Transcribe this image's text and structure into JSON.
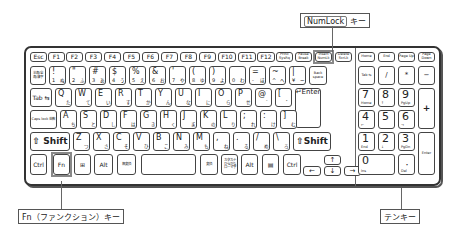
{
  "callouts": {
    "numlock": {
      "key_label": "NumLock",
      "suffix": "キー"
    },
    "fn": "Fn（ファンクション）キー",
    "tenkey": "テンキー"
  },
  "rows": {
    "function_row": [
      "Esc",
      "F1",
      "F2",
      "F3",
      "F4",
      "F5",
      "F6",
      "F7",
      "F8",
      "F9",
      "F10",
      "F11",
      "F12",
      "PrtSc SysRq",
      "Pause Break",
      "Insert NumLk",
      "Delete ScrLk"
    ],
    "nav_top": [
      "Home",
      "End",
      "Page Up",
      "Page Down"
    ],
    "number_row": [
      {
        "main": "半角/全角/漢字",
        "shift": "",
        "kana": ""
      },
      {
        "main": "1",
        "shift": "!",
        "kana": "ぬ"
      },
      {
        "main": "2",
        "shift": "\"",
        "kana": "ふ"
      },
      {
        "main": "3",
        "shift": "#",
        "kana": "あ"
      },
      {
        "main": "4",
        "shift": "$",
        "kana": "う"
      },
      {
        "main": "5",
        "shift": "%",
        "kana": "え"
      },
      {
        "main": "6",
        "shift": "&",
        "kana": "お"
      },
      {
        "main": "7",
        "shift": "'",
        "kana": "や"
      },
      {
        "main": "8",
        "shift": "(",
        "kana": "ゆ"
      },
      {
        "main": "9",
        "shift": ")",
        "kana": "よ"
      },
      {
        "main": "0",
        "shift": "",
        "kana": "わ"
      },
      {
        "main": "-",
        "shift": "=",
        "kana": "ほ"
      },
      {
        "main": "^",
        "shift": "~",
        "kana": "へ"
      },
      {
        "main": "¥",
        "shift": "|",
        "kana": "ー"
      },
      {
        "main": "Back space",
        "shift": "",
        "kana": ""
      }
    ],
    "qwerty_row": [
      {
        "main": "Tab ⇆",
        "kana": ""
      },
      {
        "main": "Q",
        "kana": "た"
      },
      {
        "main": "W",
        "kana": "て"
      },
      {
        "main": "E",
        "kana": "い"
      },
      {
        "main": "R",
        "kana": "す"
      },
      {
        "main": "T",
        "kana": "か"
      },
      {
        "main": "Y",
        "kana": "ん"
      },
      {
        "main": "U",
        "kana": "な"
      },
      {
        "main": "I",
        "kana": "に"
      },
      {
        "main": "O",
        "kana": "ら"
      },
      {
        "main": "P",
        "kana": "せ"
      },
      {
        "main": "@",
        "kana": "゛"
      },
      {
        "main": "[",
        "kana": "゜"
      },
      {
        "main": "↵Enter",
        "kana": ""
      }
    ],
    "home_row": [
      {
        "main": "Caps lock 英数",
        "kana": ""
      },
      {
        "main": "A",
        "kana": "ち"
      },
      {
        "main": "S",
        "kana": "と"
      },
      {
        "main": "D",
        "kana": "し"
      },
      {
        "main": "F",
        "kana": "は"
      },
      {
        "main": "G",
        "kana": "き"
      },
      {
        "main": "H",
        "kana": "く"
      },
      {
        "main": "J",
        "kana": "ま"
      },
      {
        "main": "K",
        "kana": "の"
      },
      {
        "main": "L",
        "kana": "り"
      },
      {
        "main": ";",
        "kana": "れ"
      },
      {
        "main": ":",
        "kana": "け"
      },
      {
        "main": "]",
        "kana": "む"
      }
    ],
    "shift_row": [
      {
        "main": "⇧ Shift",
        "kana": ""
      },
      {
        "main": "Z",
        "kana": "つ"
      },
      {
        "main": "X",
        "kana": "さ"
      },
      {
        "main": "C",
        "kana": "そ"
      },
      {
        "main": "V",
        "kana": "ひ"
      },
      {
        "main": "B",
        "kana": "こ"
      },
      {
        "main": "N",
        "kana": "み"
      },
      {
        "main": "M",
        "kana": "も"
      },
      {
        "main": ",",
        "kana": "ね"
      },
      {
        "main": ".",
        "kana": "る"
      },
      {
        "main": "/",
        "kana": "め"
      },
      {
        "main": "\\",
        "kana": "ろ"
      },
      {
        "main": "⇧Shift",
        "kana": ""
      }
    ],
    "bottom_row": [
      "Ctrl",
      "Fn",
      "⊞",
      "Alt",
      "無変換",
      "",
      "変換",
      "カタカナ ひらがな ローマ字",
      "Alt",
      "▤",
      "Ctrl"
    ],
    "arrows": [
      "↑",
      "←",
      "↓",
      "→"
    ]
  },
  "numpad": {
    "top": [
      "Tab ⇆",
      "/",
      "*",
      "−"
    ],
    "row7": [
      {
        "n": "7",
        "s": "Home"
      },
      {
        "n": "8",
        "s": "↑"
      },
      {
        "n": "9",
        "s": "PgUp"
      }
    ],
    "row4": [
      {
        "n": "4",
        "s": "←"
      },
      {
        "n": "5",
        "s": ""
      },
      {
        "n": "6",
        "s": "→"
      }
    ],
    "row1": [
      {
        "n": "1",
        "s": "End"
      },
      {
        "n": "2",
        "s": "↓"
      },
      {
        "n": "3",
        "s": "PgDn"
      }
    ],
    "row0": [
      {
        "n": "0",
        "s": "Ins"
      },
      {
        "n": "・",
        "s": "Del"
      }
    ],
    "plus": "+",
    "enter": "Enter"
  }
}
